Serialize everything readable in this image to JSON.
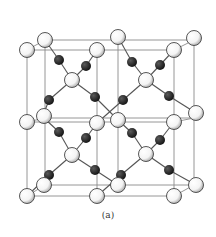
{
  "caption": "(a)",
  "colors": {
    "edge": "#8a8a8a",
    "bond": "#555555",
    "white_atom_fill": "#ffffff",
    "white_atom_stroke": "#444444",
    "black_atom_fill": "#1a1a1a"
  },
  "cube_edges": [
    [
      27,
      50,
      174,
      50
    ],
    [
      27,
      50,
      27,
      196
    ],
    [
      174,
      50,
      174,
      196
    ],
    [
      27,
      196,
      174,
      196
    ],
    [
      45,
      40,
      194,
      40
    ],
    [
      45,
      40,
      45,
      185
    ],
    [
      194,
      40,
      194,
      185
    ],
    [
      45,
      185,
      194,
      185
    ],
    [
      27,
      50,
      45,
      40
    ],
    [
      174,
      50,
      194,
      40
    ],
    [
      27,
      196,
      45,
      185
    ],
    [
      174,
      196,
      194,
      185
    ],
    [
      27,
      122,
      174,
      122
    ],
    [
      45,
      118,
      194,
      118
    ],
    [
      97,
      50,
      97,
      196
    ],
    [
      118,
      40,
      118,
      185
    ],
    [
      27,
      122,
      45,
      118
    ],
    [
      174,
      122,
      194,
      118
    ]
  ],
  "bonds": [
    [
      45,
      40,
      59,
      60
    ],
    [
      59,
      60,
      72,
      80
    ],
    [
      97,
      50,
      86,
      66
    ],
    [
      86,
      66,
      72,
      80
    ],
    [
      72,
      80,
      49,
      100
    ],
    [
      49,
      100,
      44,
      113
    ],
    [
      72,
      80,
      95,
      97
    ],
    [
      95,
      97,
      118,
      120
    ],
    [
      118,
      37,
      132,
      62
    ],
    [
      132,
      62,
      146,
      80
    ],
    [
      174,
      50,
      160,
      65
    ],
    [
      160,
      65,
      146,
      80
    ],
    [
      146,
      80,
      123,
      100
    ],
    [
      123,
      100,
      97,
      123
    ],
    [
      146,
      80,
      169,
      96
    ],
    [
      169,
      96,
      196,
      113
    ],
    [
      44,
      118,
      59,
      132
    ],
    [
      59,
      132,
      72,
      155
    ],
    [
      97,
      123,
      86,
      138
    ],
    [
      86,
      138,
      72,
      155
    ],
    [
      72,
      155,
      49,
      175
    ],
    [
      49,
      175,
      27,
      196
    ],
    [
      72,
      155,
      95,
      170
    ],
    [
      95,
      170,
      118,
      185
    ],
    [
      118,
      120,
      132,
      133
    ],
    [
      132,
      133,
      146,
      154
    ],
    [
      174,
      122,
      160,
      140
    ],
    [
      160,
      140,
      146,
      154
    ],
    [
      146,
      154,
      121,
      175
    ],
    [
      121,
      175,
      97,
      196
    ],
    [
      146,
      154,
      169,
      170
    ],
    [
      169,
      170,
      196,
      185
    ]
  ],
  "white_atoms": [
    [
      27,
      50
    ],
    [
      45,
      40
    ],
    [
      97,
      50
    ],
    [
      118,
      37
    ],
    [
      174,
      50
    ],
    [
      194,
      38
    ],
    [
      72,
      80
    ],
    [
      146,
      80
    ],
    [
      27,
      122
    ],
    [
      44,
      116
    ],
    [
      97,
      123
    ],
    [
      118,
      120
    ],
    [
      174,
      122
    ],
    [
      196,
      113
    ],
    [
      72,
      155
    ],
    [
      146,
      154
    ],
    [
      27,
      196
    ],
    [
      44,
      185
    ],
    [
      97,
      196
    ],
    [
      118,
      185
    ],
    [
      174,
      196
    ],
    [
      196,
      185
    ]
  ],
  "black_atoms": [
    [
      59,
      60
    ],
    [
      86,
      66
    ],
    [
      132,
      62
    ],
    [
      160,
      65
    ],
    [
      49,
      100
    ],
    [
      95,
      97
    ],
    [
      123,
      100
    ],
    [
      169,
      96
    ],
    [
      59,
      132
    ],
    [
      86,
      138
    ],
    [
      132,
      133
    ],
    [
      160,
      140
    ],
    [
      49,
      175
    ],
    [
      95,
      170
    ],
    [
      121,
      175
    ],
    [
      169,
      170
    ]
  ]
}
